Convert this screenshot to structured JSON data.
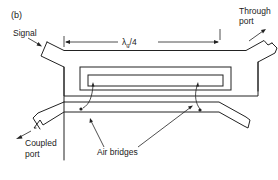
{
  "figure": {
    "panel_label": "(b)",
    "labels": {
      "signal": "Signal",
      "through_port_line1": "Through",
      "through_port_line2": "port",
      "coupled_port_line1": "Coupled",
      "coupled_port_line2": "port",
      "air_bridges": "Air bridges",
      "dimension": "λg/4",
      "dimension_main": "λ",
      "dimension_sub": "g",
      "dimension_tail": "/4"
    },
    "colors": {
      "stroke": "#222222",
      "background": "#ffffff"
    }
  }
}
